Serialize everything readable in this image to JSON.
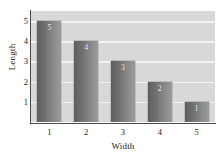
{
  "chart_data": {
    "type": "bar",
    "title": "",
    "xlabel": "Width",
    "ylabel": "Length",
    "categories": [
      "1",
      "2",
      "3",
      "4",
      "5"
    ],
    "values": [
      5,
      4,
      3,
      2,
      1
    ],
    "data_labels": [
      "5",
      "4",
      "3",
      "2",
      "1"
    ],
    "yticks": [
      "1",
      "2",
      "3",
      "4",
      "5"
    ],
    "xticks": [
      "1",
      "2",
      "3",
      "4",
      "5"
    ],
    "ylim": [
      0,
      5.5
    ],
    "grid": true,
    "legend": "none",
    "colors": {
      "plot_background": "#d8d8d8",
      "gridline": "#f2f2f2",
      "bar_dark": "#5e5e5e",
      "bar_light": "#9b9b9b",
      "axis": "#4a4a4a",
      "text": "#1a1a1a",
      "label_text": "#ffffff",
      "figure_background": "#ffffff"
    }
  }
}
